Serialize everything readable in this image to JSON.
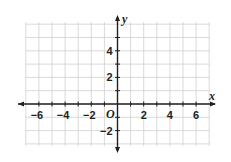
{
  "chart_data": {
    "type": "coordinate-grid",
    "title": "",
    "xlabel": "x",
    "ylabel": "y",
    "origin_label": "O",
    "xlim": [
      -7,
      7
    ],
    "ylim": [
      -3,
      6
    ],
    "grid": true,
    "grid_step": 1,
    "x_tick_labels": [
      {
        "value": -6,
        "label": "−6"
      },
      {
        "value": -4,
        "label": "−4"
      },
      {
        "value": -2,
        "label": "−2"
      },
      {
        "value": 2,
        "label": "2"
      },
      {
        "value": 4,
        "label": "4"
      },
      {
        "value": 6,
        "label": "6"
      }
    ],
    "y_tick_labels": [
      {
        "value": 4,
        "label": "4"
      },
      {
        "value": 2,
        "label": "2"
      },
      {
        "value": -2,
        "label": "−2"
      }
    ],
    "series": []
  },
  "colors": {
    "grid": "#cfcfcf",
    "axis": "#231f20",
    "background": "#ffffff"
  }
}
